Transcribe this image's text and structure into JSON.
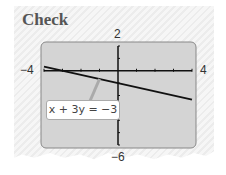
{
  "title": "Check",
  "chart_data": {
    "type": "line",
    "title": "Check",
    "xlim": [
      -4,
      4
    ],
    "ylim": [
      -6,
      2
    ],
    "xscale": 1,
    "yscale": 1,
    "tick_labels": {
      "xmin": "−4",
      "xmax": "4",
      "ymin": "−6",
      "ymax": "2"
    },
    "series": [
      {
        "name": "x + 3y = −3",
        "equation": "y = -1 - x/3",
        "x": [
          -4,
          4
        ],
        "y": [
          0.3333,
          -2.3333
        ]
      }
    ],
    "annotations": [
      {
        "text": "x + 3y = −3",
        "points_to": [
          -1,
          -0.6667
        ]
      }
    ],
    "grid": false
  }
}
